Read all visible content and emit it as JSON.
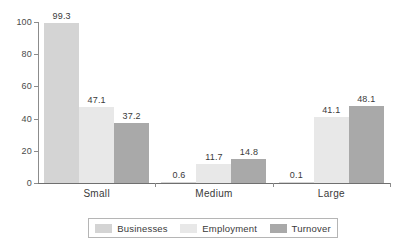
{
  "chart_data": {
    "type": "bar",
    "title": "",
    "subtitle": "",
    "xlabel": "",
    "ylabel": "",
    "ylim": [
      0,
      100
    ],
    "yticks": [
      0,
      20,
      40,
      60,
      80,
      100
    ],
    "grid": false,
    "legend_position": "bottom",
    "categories": [
      "Small",
      "Medium",
      "Large"
    ],
    "series": [
      {
        "name": "Businesses",
        "color": "#d4d4d4",
        "values": [
          99.3,
          0.6,
          0.1
        ],
        "labels": [
          "99.3",
          "0.6",
          "0.1"
        ]
      },
      {
        "name": "Employment",
        "color": "#e8e8e8",
        "values": [
          47.1,
          11.7,
          41.1
        ],
        "labels": [
          "47.1",
          "11.7",
          "41.1"
        ]
      },
      {
        "name": "Turnover",
        "color": "#a9a9a9",
        "values": [
          37.2,
          14.8,
          48.1
        ],
        "labels": [
          "37.2",
          "14.8",
          "48.1"
        ]
      }
    ]
  },
  "axis": {
    "ytick_labels": [
      "0",
      "20",
      "40",
      "60",
      "80",
      "100"
    ]
  },
  "legend": {
    "items": [
      {
        "label": "Businesses"
      },
      {
        "label": "Employment"
      },
      {
        "label": "Turnover"
      }
    ]
  }
}
